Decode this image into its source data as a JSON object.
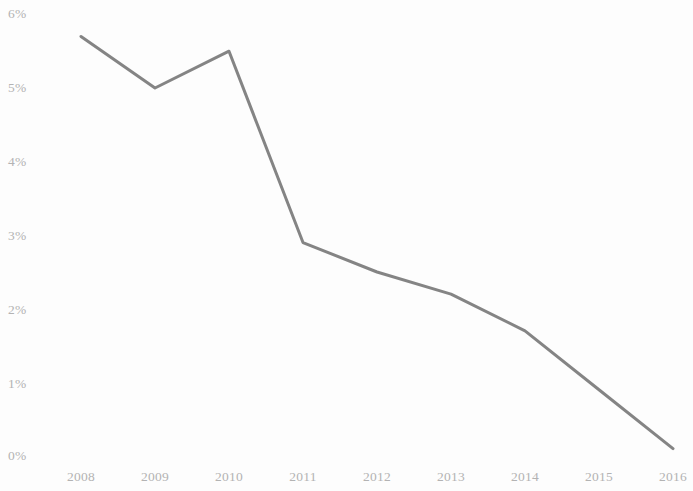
{
  "chart_data": {
    "type": "line",
    "title": "",
    "subtitle": "",
    "xlabel": "",
    "ylabel": "",
    "categories": [
      "2008",
      "2009",
      "2010",
      "2011",
      "2012",
      "2013",
      "2014",
      "2015",
      "2016"
    ],
    "values": [
      5.7,
      5.0,
      5.5,
      2.9,
      2.5,
      2.2,
      1.7,
      0.9,
      0.1
    ],
    "series": [
      {
        "name": "",
        "values": [
          5.7,
          5.0,
          5.5,
          2.9,
          2.5,
          2.2,
          1.7,
          0.9,
          0.1
        ]
      }
    ],
    "ylim": [
      0,
      6
    ],
    "ytick_labels": [
      "6%",
      "5%",
      "4%",
      "3%",
      "2%",
      "1%",
      "0%"
    ],
    "ytick_values": [
      6,
      5,
      4,
      3,
      2,
      1,
      0
    ],
    "xtick_labels": [
      "2008",
      "2009",
      "2010",
      "2011",
      "2012",
      "2013",
      "2014",
      "2015",
      "2016"
    ],
    "grid": false,
    "legend": false,
    "legend_position": "none",
    "annotations": [],
    "line_color": "#7a7a7a",
    "tick_label_color": "#b3b3b3",
    "background_color": "#fdfdfd",
    "value_unit": "%"
  }
}
